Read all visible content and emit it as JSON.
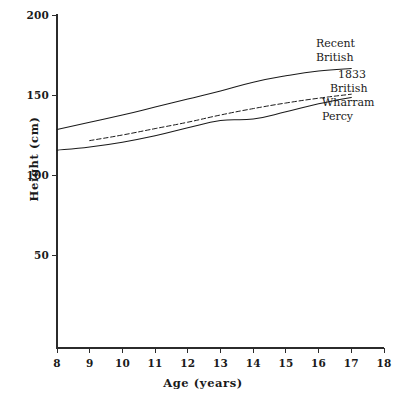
{
  "chart_data": {
    "type": "line",
    "title": "",
    "xlabel": "Age  (years)",
    "ylabel": "Height  (cm)",
    "xlim": [
      8,
      18
    ],
    "ylim": [
      0,
      200
    ],
    "xticks": [
      8,
      9,
      10,
      11,
      12,
      13,
      14,
      15,
      16,
      17,
      18
    ],
    "yticks": [
      50,
      100,
      150,
      200
    ],
    "grid": false,
    "legend_position": "inline-right-annotations",
    "x": [
      8,
      9,
      10,
      11,
      12,
      13,
      14,
      15,
      16,
      17
    ],
    "series": [
      {
        "name": "Recent British",
        "style": "solid",
        "color": "#1a1a1a",
        "x": [
          8,
          9,
          10,
          11,
          12,
          13,
          14,
          15,
          16,
          17
        ],
        "values": [
          128.5,
          133.0,
          137.5,
          142.5,
          147.5,
          152.5,
          158.0,
          162.0,
          165.0,
          166.5
        ]
      },
      {
        "name": "1833 British",
        "style": "dashed",
        "color": "#1a1a1a",
        "x": [
          9,
          10,
          11,
          12,
          13,
          14,
          15,
          16,
          17
        ],
        "values": [
          121.5,
          125.0,
          129.0,
          133.0,
          137.5,
          141.5,
          145.0,
          148.0,
          150.5
        ]
      },
      {
        "name": "Wharram Percy",
        "style": "solid",
        "color": "#1a1a1a",
        "x": [
          8,
          9,
          10,
          11,
          12,
          13,
          14,
          15,
          16,
          17
        ],
        "values": [
          115.5,
          117.5,
          120.5,
          124.5,
          129.5,
          134.0,
          135.0,
          139.5,
          144.5,
          148.5
        ]
      }
    ]
  },
  "axes": {
    "y_title": "Height  (cm)",
    "x_title": "Age  (years)",
    "y_tick_labels": [
      "200",
      "150",
      "100",
      "50"
    ],
    "x_tick_labels": [
      "8",
      "9",
      "10",
      "11",
      "12",
      "13",
      "14",
      "15",
      "16",
      "17",
      "18"
    ]
  },
  "annotations": {
    "recent_british": {
      "line1": "Recent",
      "line2": "British"
    },
    "british_1833": {
      "line1": "1833",
      "line2": "British"
    },
    "wharram_percy": {
      "line1": "Wharram",
      "line2": "Percy"
    }
  }
}
